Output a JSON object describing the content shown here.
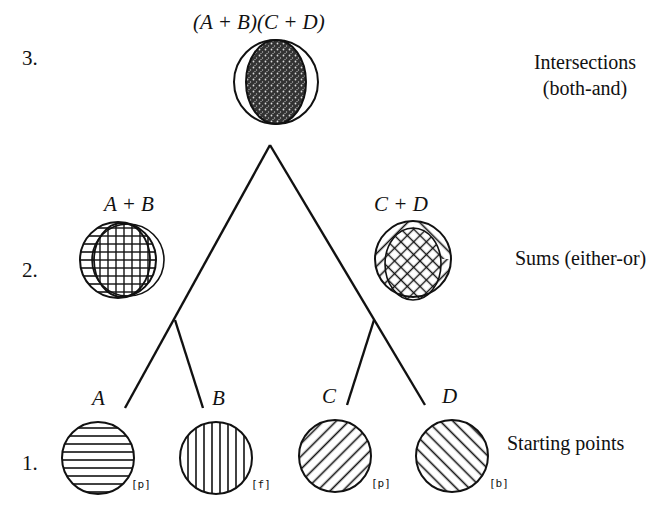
{
  "levels": [
    {
      "number": "3.",
      "formula": "(A + B)(C + D)",
      "description_line1": "Intersections",
      "description_line2": "(both-and)"
    },
    {
      "number": "2.",
      "left_formula": "A + B",
      "right_formula": "C + D",
      "description": "Sums (either-or)"
    },
    {
      "number": "1.",
      "description": "Starting points"
    }
  ],
  "nodes": [
    {
      "label": "A",
      "tag": "[p]",
      "pattern": "horizontal-hatch"
    },
    {
      "label": "B",
      "tag": "[f]",
      "pattern": "vertical-hatch"
    },
    {
      "label": "C",
      "tag": "[p]",
      "pattern": "diagonal-hatch-up"
    },
    {
      "label": "D",
      "tag": "[b]",
      "pattern": "diagonal-hatch-down"
    }
  ],
  "colors": {
    "ink": "#111111",
    "paper": "#ffffff"
  }
}
